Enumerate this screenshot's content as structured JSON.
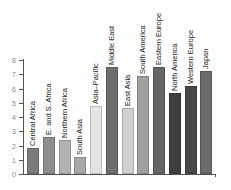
{
  "chart_data": {
    "type": "bar",
    "title": "",
    "xlabel": "",
    "ylabel": "",
    "ylim": [
      0,
      8
    ],
    "yticks": [
      0,
      1,
      2,
      3,
      4,
      5,
      6,
      7,
      8
    ],
    "grid": false,
    "legend": null,
    "categories": [
      "Central Africa",
      "E. and S. Africa",
      "Northern Africa",
      "South Asia",
      "Asia–Pacific",
      "Middle East",
      "East Asia",
      "South America",
      "Eastern Europe",
      "North America",
      "Western Europe",
      "Japan"
    ],
    "values": [
      1.8,
      2.6,
      2.4,
      1.2,
      4.8,
      7.5,
      4.6,
      6.9,
      7.5,
      5.7,
      6.2,
      7.2
    ],
    "colors": [
      "#7c7c7c",
      "#8e8e8e",
      "#b3b3b3",
      "#a9a9a9",
      "#e6e6e6",
      "#6e6e6e",
      "#cfcfcf",
      "#a0a0a0",
      "#666666",
      "#3e3e3e",
      "#484848",
      "#6c6c6c"
    ]
  }
}
